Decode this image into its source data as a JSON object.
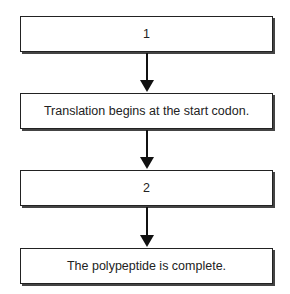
{
  "flowchart": {
    "steps": [
      {
        "label": "1"
      },
      {
        "label": "Translation begins at the start codon."
      },
      {
        "label": "2"
      },
      {
        "label": "The polypeptide is complete."
      }
    ]
  }
}
